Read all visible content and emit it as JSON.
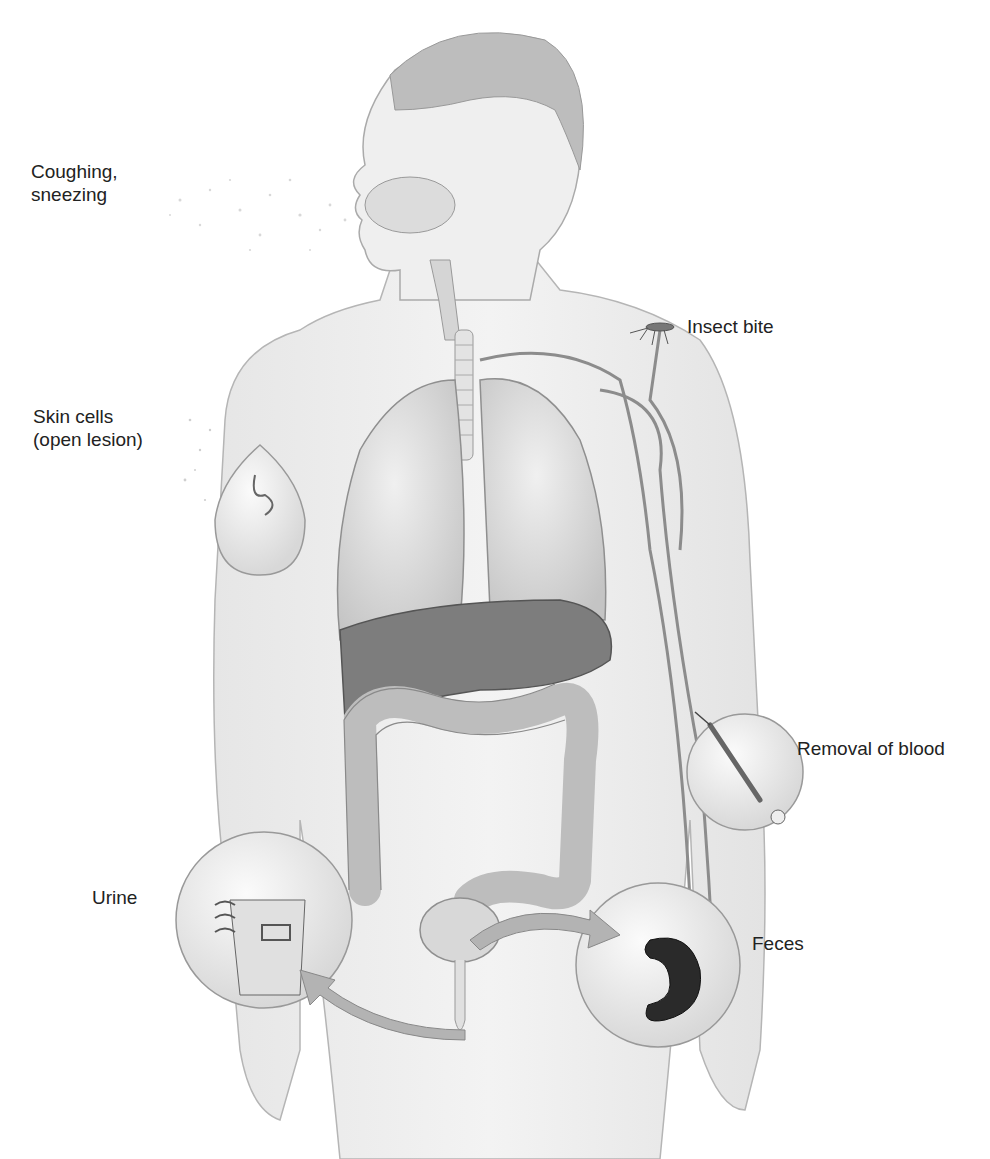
{
  "diagram": {
    "type": "anatomical-illustration",
    "labels": [
      {
        "id": "coughing",
        "text": "Coughing,\nsneezing"
      },
      {
        "id": "skin",
        "text": "Skin cells\n(open lesion)"
      },
      {
        "id": "insect",
        "text": "Insect bite"
      },
      {
        "id": "blood",
        "text": "Removal of blood"
      },
      {
        "id": "urine",
        "text": "Urine"
      },
      {
        "id": "feces",
        "text": "Feces"
      }
    ],
    "colors": {
      "skin": "#ececec",
      "outline": "#9a9a9a",
      "lung": "#d9d9d9",
      "liver": "#7a7a7a",
      "colon": "#cfcfcf",
      "vessel": "#8c8c8c",
      "feces": "#2a2a2a",
      "inset": "#f4f4f4"
    }
  }
}
